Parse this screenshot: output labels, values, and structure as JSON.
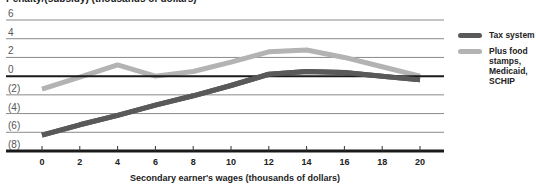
{
  "chart_data": {
    "type": "line",
    "title": "",
    "ylabel": "Penalty/(subsidy) (thousands of dollars)",
    "xlabel": "Secondary earner's wages (thousands of dollars)",
    "x": [
      0,
      2,
      4,
      6,
      8,
      10,
      12,
      14,
      16,
      18,
      20
    ],
    "xticks": [
      "0",
      "2",
      "4",
      "6",
      "8",
      "10",
      "12",
      "14",
      "16",
      "18",
      "20"
    ],
    "yticks": [
      "6",
      "4",
      "2",
      "0",
      "(2)",
      "(4)",
      "(6)",
      "(8)"
    ],
    "ylim": [
      -8,
      6
    ],
    "xlim": [
      0,
      20
    ],
    "grid": true,
    "legend_position": "right",
    "series": [
      {
        "name": "Tax system",
        "color": "#595959",
        "values": [
          -6.3,
          -5.2,
          -4.2,
          -3.1,
          -2.1,
          -1.0,
          0.2,
          0.5,
          0.4,
          0.0,
          -0.4
        ]
      },
      {
        "name": "Plus food stamps, Medicaid, SCHIP",
        "color": "#b3b3b3",
        "values": [
          -1.4,
          -0.1,
          1.2,
          0.0,
          0.5,
          1.5,
          2.6,
          2.8,
          2.0,
          1.0,
          0.0
        ]
      }
    ]
  },
  "legend": {
    "items": [
      {
        "label": "Tax system",
        "color": "#595959"
      },
      {
        "label": "Plus food stamps, Medicaid, SCHIP",
        "color": "#b3b3b3",
        "lines": [
          "Plus food",
          "stamps,",
          "Medicaid,",
          "SCHIP"
        ]
      }
    ]
  }
}
